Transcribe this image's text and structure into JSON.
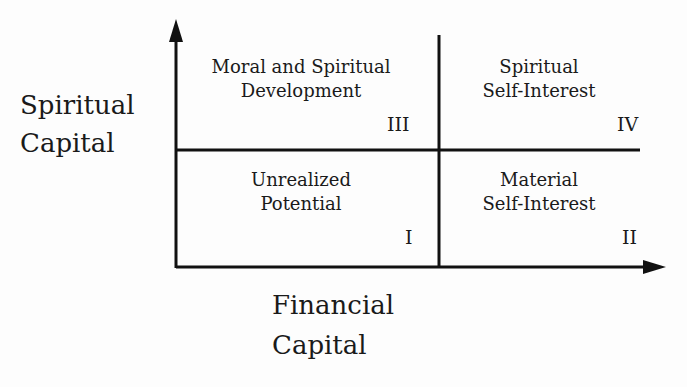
{
  "diagram": {
    "y_axis_label": [
      "Spiritual",
      "Capital"
    ],
    "x_axis_label": [
      "Financial",
      "Capital"
    ],
    "quadrants": [
      {
        "id": "III",
        "position": "top-left",
        "lines": [
          "Moral and Spiritual",
          "Development"
        ],
        "numeral": "III"
      },
      {
        "id": "IV",
        "position": "top-right",
        "lines": [
          "Spiritual",
          "Self-Interest"
        ],
        "numeral": "IV"
      },
      {
        "id": "I",
        "position": "bottom-left",
        "lines": [
          "Unrealized",
          "Potential"
        ],
        "numeral": "I"
      },
      {
        "id": "II",
        "position": "bottom-right",
        "lines": [
          "Material",
          "Self-Interest"
        ],
        "numeral": "II"
      }
    ],
    "colors": {
      "line": "#111111",
      "text": "#1a1a1a",
      "background": "#fdfdfd"
    }
  }
}
